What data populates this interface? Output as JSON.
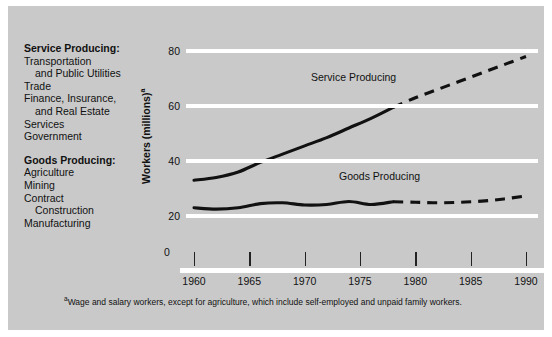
{
  "figure": {
    "background_color": "#c9c9c9",
    "grid_color": "#ffffff",
    "line_color": "#111111"
  },
  "legend": {
    "groups": [
      {
        "heading": "Service Producing:",
        "items": [
          {
            "text": "Transportation",
            "indent": false
          },
          {
            "text": "and Public Utilities",
            "indent": true
          },
          {
            "text": "Trade",
            "indent": false
          },
          {
            "text": "Finance, Insurance,",
            "indent": false
          },
          {
            "text": "and Real Estate",
            "indent": true
          },
          {
            "text": "Services",
            "indent": false
          },
          {
            "text": "Government",
            "indent": false
          }
        ]
      },
      {
        "heading": "Goods Producing:",
        "items": [
          {
            "text": "Agriculture",
            "indent": false
          },
          {
            "text": "Mining",
            "indent": false
          },
          {
            "text": "Contract",
            "indent": false
          },
          {
            "text": "Construction",
            "indent": true
          },
          {
            "text": "Manufacturing",
            "indent": false
          }
        ]
      }
    ]
  },
  "footnote": {
    "marker": "a",
    "text": "Wage and salary workers, except for agriculture, which include self-employed and unpaid family workers."
  },
  "axis_title": {
    "text": "Workers (millions)",
    "marker": "a"
  },
  "series_labels": {
    "service": "Service Producing",
    "goods": "Goods Producing"
  },
  "chart_data": {
    "type": "line",
    "title": "",
    "subtitle": "",
    "xlabel": "",
    "ylabel": "Workers (millions)",
    "xlim": [
      1958,
      1991
    ],
    "ylim": [
      0,
      85
    ],
    "yticks": [
      0,
      20,
      40,
      60,
      80
    ],
    "ytick_labels": [
      "0",
      "20",
      "40",
      "60",
      "80"
    ],
    "xticks": [
      1960,
      1965,
      1970,
      1975,
      1980,
      1985,
      1990
    ],
    "xtick_labels": [
      "1960",
      "1965",
      "1970",
      "1975",
      "1980",
      "1985",
      "1990"
    ],
    "grid": "horizontal",
    "legend_position": "inline-annotation",
    "series": [
      {
        "name": "Service Producing",
        "style_actual": "solid",
        "style_projected": "dashed",
        "projection_starts": 1978,
        "x": [
          1960,
          1962,
          1964,
          1966,
          1968,
          1970,
          1972,
          1974,
          1976,
          1978,
          1980,
          1982,
          1984,
          1986,
          1988,
          1990
        ],
        "values": [
          33.0,
          34.0,
          36.0,
          39.5,
          42.5,
          45.5,
          48.5,
          52.0,
          55.5,
          59.5,
          63.0,
          66.0,
          69.0,
          72.0,
          75.0,
          78.0
        ]
      },
      {
        "name": "Goods Producing",
        "style_actual": "solid",
        "style_projected": "dashed",
        "projection_starts": 1978,
        "x": [
          1960,
          1962,
          1964,
          1966,
          1968,
          1970,
          1972,
          1974,
          1976,
          1978,
          1980,
          1982,
          1984,
          1986,
          1988,
          1990
        ],
        "values": [
          23.0,
          22.5,
          23.0,
          24.5,
          24.8,
          24.0,
          24.2,
          25.3,
          24.2,
          25.2,
          25.0,
          24.8,
          25.0,
          25.4,
          26.2,
          27.3
        ]
      }
    ]
  }
}
